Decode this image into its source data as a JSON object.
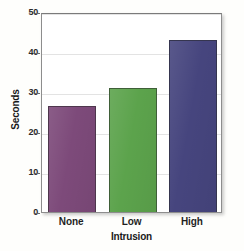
{
  "chart_data": {
    "type": "bar",
    "title": "",
    "subtitle": "",
    "categories": [
      "None",
      "Low",
      "High"
    ],
    "values": [
      26.5,
      31,
      43
    ],
    "series": [
      {
        "name": "Seconds",
        "values": [
          26.5,
          31,
          43
        ]
      }
    ],
    "xlabel": "Intrusion",
    "ylabel": "Seconds",
    "ylim": [
      0,
      50
    ],
    "yticks": [
      "0",
      "10",
      "20",
      "30",
      "40",
      "50"
    ],
    "ytick_values": [
      0,
      10,
      20,
      30,
      40,
      50
    ],
    "grid": true,
    "grid_axis": "y",
    "legend": false,
    "legend_position": "none",
    "bar_colors": [
      "#7d4a7a",
      "#5ca34c",
      "#46457e"
    ],
    "bar_border_color": "#2a2a2a",
    "plot_background": "#ffffff",
    "plot_border_color": "#8d8d8d",
    "figure_background": "#fefefc"
  }
}
